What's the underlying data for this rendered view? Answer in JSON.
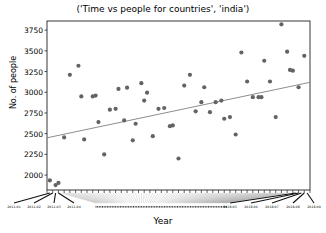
{
  "chart_data": {
    "type": "scatter",
    "title": "('Time vs people for countries', 'india')",
    "xlabel": "Year",
    "ylabel": "No. of people",
    "ylim": [
      1820,
      3860
    ],
    "xlim": [
      0,
      92
    ],
    "yticks": [
      2000,
      2250,
      2500,
      2750,
      3000,
      3250,
      3500,
      3750
    ],
    "ytick_labels": [
      "2000",
      "2250",
      "2500",
      "2750",
      "3000",
      "3250",
      "3500",
      "3750"
    ],
    "grid": false,
    "legend": false,
    "marker_color": "#636363",
    "line_color": "#808080",
    "frame_color": "#222222",
    "xtick_labels_visible": [
      {
        "label": "2011-01",
        "x": 1
      },
      {
        "label": "2011-02",
        "x": 2
      },
      {
        "label": "2011-03",
        "x": 3
      },
      {
        "label": "2011-04",
        "x": 4
      },
      {
        "label": "2018-05",
        "x": 87
      },
      {
        "label": "2018-06",
        "x": 88
      },
      {
        "label": "2018-07",
        "x": 89
      },
      {
        "label": "2018-08",
        "x": 90
      },
      {
        "label": "2018-09",
        "x": 91
      }
    ],
    "trendline": {
      "x0": 0,
      "y0": 2450,
      "x1": 92,
      "y1": 3120
    },
    "points": [
      {
        "x": 1,
        "y": 1935
      },
      {
        "x": 3,
        "y": 1880
      },
      {
        "x": 4,
        "y": 1905
      },
      {
        "x": 6,
        "y": 2455
      },
      {
        "x": 8,
        "y": 3210
      },
      {
        "x": 11,
        "y": 3320
      },
      {
        "x": 12,
        "y": 2950
      },
      {
        "x": 13,
        "y": 2430
      },
      {
        "x": 16,
        "y": 2950
      },
      {
        "x": 17,
        "y": 2960
      },
      {
        "x": 18,
        "y": 2640
      },
      {
        "x": 20,
        "y": 2250
      },
      {
        "x": 22,
        "y": 2790
      },
      {
        "x": 24,
        "y": 2800
      },
      {
        "x": 25,
        "y": 3040
      },
      {
        "x": 27,
        "y": 2660
      },
      {
        "x": 28,
        "y": 3055
      },
      {
        "x": 30,
        "y": 2420
      },
      {
        "x": 31,
        "y": 2620
      },
      {
        "x": 33,
        "y": 3110
      },
      {
        "x": 34,
        "y": 2900
      },
      {
        "x": 35,
        "y": 2995
      },
      {
        "x": 37,
        "y": 2470
      },
      {
        "x": 39,
        "y": 2800
      },
      {
        "x": 41,
        "y": 2810
      },
      {
        "x": 43,
        "y": 2590
      },
      {
        "x": 44,
        "y": 2600
      },
      {
        "x": 46,
        "y": 2200
      },
      {
        "x": 48,
        "y": 3080
      },
      {
        "x": 50,
        "y": 3210
      },
      {
        "x": 52,
        "y": 2770
      },
      {
        "x": 54,
        "y": 2880
      },
      {
        "x": 55,
        "y": 3060
      },
      {
        "x": 57,
        "y": 2760
      },
      {
        "x": 59,
        "y": 2880
      },
      {
        "x": 61,
        "y": 2900
      },
      {
        "x": 62,
        "y": 2680
      },
      {
        "x": 64,
        "y": 2700
      },
      {
        "x": 66,
        "y": 2490
      },
      {
        "x": 68,
        "y": 3480
      },
      {
        "x": 70,
        "y": 3130
      },
      {
        "x": 72,
        "y": 2940
      },
      {
        "x": 74,
        "y": 2940
      },
      {
        "x": 75,
        "y": 2940
      },
      {
        "x": 76,
        "y": 3380
      },
      {
        "x": 78,
        "y": 3130
      },
      {
        "x": 80,
        "y": 2700
      },
      {
        "x": 82,
        "y": 3820
      },
      {
        "x": 84,
        "y": 3490
      },
      {
        "x": 85,
        "y": 3270
      },
      {
        "x": 86,
        "y": 3260
      },
      {
        "x": 88,
        "y": 3060
      },
      {
        "x": 90,
        "y": 3440
      }
    ]
  }
}
